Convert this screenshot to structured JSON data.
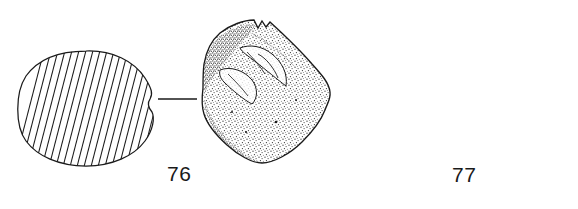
{
  "plate": {
    "kind": "archaeological-artifact-illustration",
    "background_color": "#ffffff",
    "ink_color": "#1a1a1a",
    "caption_font_size_px": 21
  },
  "figures": [
    {
      "id": "figure-76",
      "label": "76",
      "label_position": {
        "x": 167,
        "y": 162
      },
      "description": "Cross-section with diagonal hatching linked to stippled artifact view",
      "objects": [
        {
          "name": "hatched-section-76",
          "role": "section-view",
          "shape": "irregular-circle",
          "fill": "diagonal-hatching",
          "hatch_line_count": 20,
          "hatch_spacing_px": 7,
          "hatch_angle_deg": 72,
          "bounds": {
            "x": 18,
            "y": 50,
            "w": 136,
            "h": 117
          }
        },
        {
          "name": "leader-line-76",
          "role": "leader-line",
          "style": "horizontal",
          "from": {
            "x": 158,
            "y": 99
          },
          "to": {
            "x": 197,
            "y": 99
          }
        },
        {
          "name": "stippled-artifact-76",
          "role": "elevation-view",
          "shape": "faceted-pentagonal-nodule-with-notched-apex",
          "fill": "stipple",
          "bounds": {
            "x": 201,
            "y": 18,
            "w": 130,
            "h": 146
          }
        }
      ]
    },
    {
      "id": "figure-77",
      "label": "77",
      "label_position": {
        "x": 452,
        "y": 163
      },
      "description": "Small hatched section, ridged cylindrical vessel and rounded pebble view",
      "objects": [
        {
          "name": "hatched-section-77",
          "role": "section-view",
          "shape": "small-lobed-blob",
          "fill": "diagonal-hatching",
          "hatch_line_count": 9,
          "hatch_spacing_px": 5,
          "hatch_angle_deg": 62,
          "bounds": {
            "x": 390,
            "y": 82,
            "w": 40,
            "h": 36
          }
        },
        {
          "name": "leader-line-77-left",
          "role": "leader-line",
          "style": "horizontal",
          "from": {
            "x": 428,
            "y": 100
          },
          "to": {
            "x": 448,
            "y": 100
          }
        },
        {
          "name": "ridged-vessel-77",
          "role": "elevation-view",
          "shape": "cylindrical-vessel-with-flared-rim-and-vertical-ridges",
          "fill": "stipple-with-ridges",
          "ridge_count": 3,
          "bounds": {
            "x": 447,
            "y": 66,
            "w": 48,
            "h": 56
          }
        },
        {
          "name": "leader-line-77-right",
          "role": "leader-line",
          "style": "angled-with-end-tick",
          "from": {
            "x": 487,
            "y": 78
          },
          "to": {
            "x": 529,
            "y": 68
          }
        },
        {
          "name": "pebble-artifact-77",
          "role": "plan-view",
          "shape": "rounded-triangular-pebble",
          "fill": "light-stipple",
          "bounds": {
            "x": 505,
            "y": 72,
            "w": 54,
            "h": 58
          }
        }
      ]
    }
  ]
}
